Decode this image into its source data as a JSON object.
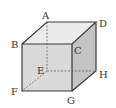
{
  "diagram": {
    "type": "cube",
    "colors": {
      "edge": "#3a3a3a",
      "hidden_edge": "#666666",
      "front_face": "#d6d6d6",
      "top_face": "#ececec",
      "side_face": "#c4c4c4"
    },
    "vertices": {
      "A": {
        "label": "A",
        "x": 47,
        "y": 22
      },
      "B": {
        "label": "B",
        "x": 22,
        "y": 44
      },
      "C": {
        "label": "C",
        "x": 72,
        "y": 44
      },
      "D": {
        "label": "D",
        "x": 96,
        "y": 22
      },
      "E": {
        "label": "E",
        "x": 47,
        "y": 71
      },
      "F": {
        "label": "F",
        "x": 22,
        "y": 91
      },
      "G": {
        "label": "G",
        "x": 72,
        "y": 91
      },
      "H": {
        "label": "H",
        "x": 96,
        "y": 71
      }
    },
    "hidden_edges": [
      "AE",
      "EF",
      "EH"
    ]
  }
}
